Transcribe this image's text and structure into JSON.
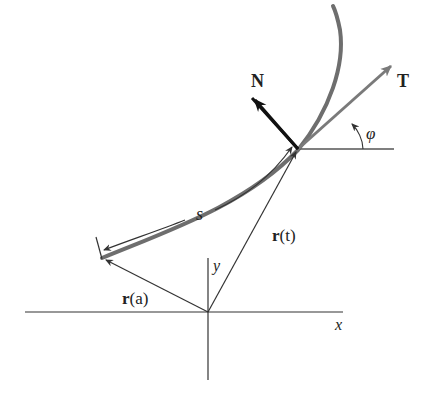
{
  "diagram": {
    "labels": {
      "normal": "N",
      "tangent": "T",
      "angle": "φ",
      "arc_length": "s",
      "position_t_bold": "r",
      "position_t_arg": "(t)",
      "position_a_bold": "r",
      "position_a_arg": "(a)",
      "x_axis": "x",
      "y_axis": "y"
    },
    "colors": {
      "curve": "#6e6e6e",
      "tangent_vector": "#7a7a7a",
      "normal_vector": "#111111",
      "axes": "#333333",
      "position_vectors": "#333333"
    }
  }
}
